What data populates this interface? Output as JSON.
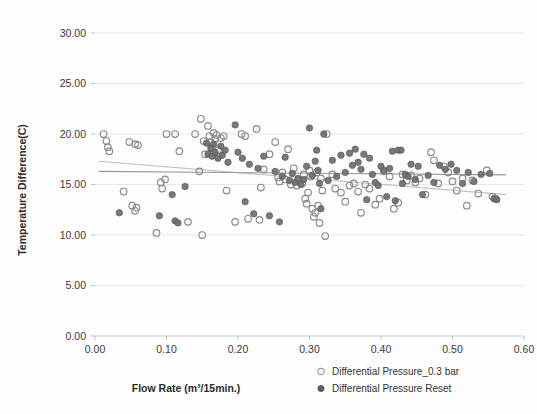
{
  "chart_data": {
    "type": "scatter",
    "title": "",
    "xlabel": "Flow Rate (m³/15min.)",
    "ylabel": "Temperature Difference(C)",
    "xlim": [
      0.0,
      0.6
    ],
    "ylim": [
      0.0,
      30.0
    ],
    "xticks": [
      "0.00",
      "0.10",
      "0.20",
      "0.30",
      "0.40",
      "0.50",
      "0.60"
    ],
    "yticks": [
      "0.00",
      "5.00",
      "10.00",
      "15.00",
      "20.00",
      "25.00",
      "30.00"
    ],
    "xtick_values": [
      0.0,
      0.1,
      0.2,
      0.3,
      0.4,
      0.5,
      0.6
    ],
    "ytick_values": [
      0.0,
      5.0,
      10.0,
      15.0,
      20.0,
      25.0,
      30.0
    ],
    "grid": true,
    "grid_axis": "y",
    "legend_position": "bottom-right",
    "series": [
      {
        "name": "Differential Pressure_0.3 bar",
        "marker": "open-circle",
        "color": "#ffffff",
        "edge_color": "#8a8a8a",
        "points": [
          [
            0.012,
            20.0
          ],
          [
            0.016,
            19.3
          ],
          [
            0.018,
            18.7
          ],
          [
            0.02,
            18.3
          ],
          [
            0.048,
            19.2
          ],
          [
            0.056,
            19.0
          ],
          [
            0.06,
            18.9
          ],
          [
            0.04,
            14.3
          ],
          [
            0.052,
            12.9
          ],
          [
            0.056,
            12.4
          ],
          [
            0.058,
            12.7
          ],
          [
            0.086,
            10.2
          ],
          [
            0.092,
            15.2
          ],
          [
            0.094,
            14.6
          ],
          [
            0.098,
            15.5
          ],
          [
            0.1,
            20.0
          ],
          [
            0.112,
            20.0
          ],
          [
            0.118,
            18.3
          ],
          [
            0.13,
            11.3
          ],
          [
            0.14,
            20.0
          ],
          [
            0.146,
            16.3
          ],
          [
            0.148,
            21.5
          ],
          [
            0.15,
            10.0
          ],
          [
            0.152,
            19.3
          ],
          [
            0.154,
            18.0
          ],
          [
            0.158,
            20.8
          ],
          [
            0.16,
            19.8
          ],
          [
            0.162,
            19.2
          ],
          [
            0.164,
            18.6
          ],
          [
            0.166,
            20.1
          ],
          [
            0.168,
            19.5
          ],
          [
            0.17,
            19.9
          ],
          [
            0.172,
            18.4
          ],
          [
            0.176,
            19.6
          ],
          [
            0.18,
            19.8
          ],
          [
            0.184,
            14.4
          ],
          [
            0.196,
            11.3
          ],
          [
            0.205,
            20.0
          ],
          [
            0.21,
            19.8
          ],
          [
            0.214,
            11.6
          ],
          [
            0.226,
            20.5
          ],
          [
            0.23,
            11.5
          ],
          [
            0.232,
            14.7
          ],
          [
            0.236,
            16.5
          ],
          [
            0.244,
            18.0
          ],
          [
            0.252,
            19.2
          ],
          [
            0.256,
            15.7
          ],
          [
            0.258,
            15.3
          ],
          [
            0.262,
            16.2
          ],
          [
            0.266,
            15.5
          ],
          [
            0.27,
            18.5
          ],
          [
            0.274,
            15.0
          ],
          [
            0.278,
            16.6
          ],
          [
            0.282,
            14.9
          ],
          [
            0.286,
            15.4
          ],
          [
            0.29,
            15.1
          ],
          [
            0.292,
            16.0
          ],
          [
            0.294,
            13.6
          ],
          [
            0.296,
            13.1
          ],
          [
            0.298,
            14.2
          ],
          [
            0.3,
            16.4
          ],
          [
            0.302,
            15.8
          ],
          [
            0.304,
            12.6
          ],
          [
            0.306,
            11.8
          ],
          [
            0.308,
            12.2
          ],
          [
            0.31,
            16.2
          ],
          [
            0.312,
            12.9
          ],
          [
            0.314,
            11.2
          ],
          [
            0.316,
            15.6
          ],
          [
            0.318,
            14.4
          ],
          [
            0.322,
            9.9
          ],
          [
            0.324,
            20.0
          ],
          [
            0.332,
            16.0
          ],
          [
            0.336,
            14.6
          ],
          [
            0.344,
            14.2
          ],
          [
            0.35,
            13.3
          ],
          [
            0.356,
            14.9
          ],
          [
            0.362,
            15.1
          ],
          [
            0.368,
            14.3
          ],
          [
            0.372,
            12.2
          ],
          [
            0.378,
            15.0
          ],
          [
            0.384,
            14.6
          ],
          [
            0.392,
            13.0
          ],
          [
            0.398,
            13.6
          ],
          [
            0.404,
            16.3
          ],
          [
            0.412,
            15.8
          ],
          [
            0.418,
            12.6
          ],
          [
            0.424,
            13.2
          ],
          [
            0.43,
            16.0
          ],
          [
            0.436,
            15.4
          ],
          [
            0.442,
            15.9
          ],
          [
            0.448,
            15.2
          ],
          [
            0.454,
            15.6
          ],
          [
            0.462,
            14.0
          ],
          [
            0.47,
            18.2
          ],
          [
            0.474,
            17.4
          ],
          [
            0.48,
            15.1
          ],
          [
            0.488,
            16.8
          ],
          [
            0.494,
            16.2
          ],
          [
            0.5,
            15.3
          ],
          [
            0.506,
            14.4
          ],
          [
            0.514,
            15.6
          ],
          [
            0.52,
            12.9
          ],
          [
            0.528,
            15.4
          ],
          [
            0.536,
            14.1
          ],
          [
            0.548,
            16.4
          ],
          [
            0.556,
            13.8
          ],
          [
            0.56,
            13.6
          ]
        ]
      },
      {
        "name": "Differential Pressure Reset",
        "marker": "filled-circle",
        "color": "#6e6e6e",
        "edge_color": "#5a5a5a",
        "points": [
          [
            0.034,
            12.2
          ],
          [
            0.09,
            11.9
          ],
          [
            0.108,
            14.0
          ],
          [
            0.112,
            11.4
          ],
          [
            0.116,
            11.2
          ],
          [
            0.126,
            14.8
          ],
          [
            0.156,
            19.1
          ],
          [
            0.158,
            18.0
          ],
          [
            0.162,
            18.6
          ],
          [
            0.164,
            17.8
          ],
          [
            0.166,
            19.0
          ],
          [
            0.168,
            18.2
          ],
          [
            0.172,
            17.6
          ],
          [
            0.176,
            18.8
          ],
          [
            0.178,
            17.9
          ],
          [
            0.182,
            18.4
          ],
          [
            0.186,
            17.2
          ],
          [
            0.196,
            20.9
          ],
          [
            0.2,
            18.2
          ],
          [
            0.206,
            17.6
          ],
          [
            0.21,
            13.3
          ],
          [
            0.216,
            17.0
          ],
          [
            0.222,
            12.1
          ],
          [
            0.228,
            16.6
          ],
          [
            0.236,
            17.8
          ],
          [
            0.244,
            11.9
          ],
          [
            0.252,
            16.3
          ],
          [
            0.258,
            11.3
          ],
          [
            0.262,
            15.8
          ],
          [
            0.266,
            17.7
          ],
          [
            0.272,
            15.4
          ],
          [
            0.276,
            16.1
          ],
          [
            0.28,
            15.2
          ],
          [
            0.284,
            15.6
          ],
          [
            0.288,
            15.0
          ],
          [
            0.292,
            15.5
          ],
          [
            0.296,
            16.8
          ],
          [
            0.3,
            20.6
          ],
          [
            0.304,
            15.9
          ],
          [
            0.308,
            17.3
          ],
          [
            0.31,
            18.4
          ],
          [
            0.312,
            16.4
          ],
          [
            0.314,
            15.1
          ],
          [
            0.316,
            12.6
          ],
          [
            0.32,
            20.0
          ],
          [
            0.326,
            15.4
          ],
          [
            0.332,
            17.4
          ],
          [
            0.338,
            15.8
          ],
          [
            0.344,
            17.9
          ],
          [
            0.35,
            16.2
          ],
          [
            0.356,
            18.1
          ],
          [
            0.36,
            16.9
          ],
          [
            0.364,
            18.5
          ],
          [
            0.368,
            17.2
          ],
          [
            0.372,
            16.5
          ],
          [
            0.376,
            18.0
          ],
          [
            0.38,
            13.5
          ],
          [
            0.384,
            17.6
          ],
          [
            0.388,
            16.0
          ],
          [
            0.392,
            15.2
          ],
          [
            0.396,
            14.9
          ],
          [
            0.4,
            16.8
          ],
          [
            0.404,
            16.4
          ],
          [
            0.408,
            13.8
          ],
          [
            0.412,
            16.6
          ],
          [
            0.416,
            18.3
          ],
          [
            0.42,
            13.4
          ],
          [
            0.424,
            18.4
          ],
          [
            0.428,
            18.4
          ],
          [
            0.43,
            15.1
          ],
          [
            0.434,
            16.0
          ],
          [
            0.438,
            15.8
          ],
          [
            0.442,
            17.0
          ],
          [
            0.448,
            15.5
          ],
          [
            0.452,
            16.8
          ],
          [
            0.458,
            14.0
          ],
          [
            0.466,
            15.9
          ],
          [
            0.474,
            15.2
          ],
          [
            0.482,
            16.9
          ],
          [
            0.49,
            16.5
          ],
          [
            0.498,
            17.0
          ],
          [
            0.506,
            16.4
          ],
          [
            0.514,
            15.1
          ],
          [
            0.522,
            16.2
          ],
          [
            0.53,
            15.3
          ],
          [
            0.54,
            16.0
          ],
          [
            0.552,
            16.1
          ],
          [
            0.558,
            13.6
          ],
          [
            0.562,
            13.5
          ]
        ]
      }
    ],
    "trendlines": [
      {
        "name": "Differential Pressure_0.3 bar trend",
        "color": "#c0c0c0",
        "x0": 0.005,
        "y0": 17.3,
        "x1": 0.575,
        "y1": 14.0
      },
      {
        "name": "Differential Pressure Reset trend",
        "color": "#9a9a9a",
        "x0": 0.005,
        "y0": 16.3,
        "x1": 0.575,
        "y1": 15.95
      }
    ]
  },
  "legend": {
    "items": [
      {
        "label": "Differential Pressure_0.3 bar",
        "marker": "open-circle"
      },
      {
        "label": "Differential Pressure Reset",
        "marker": "filled-circle"
      }
    ]
  },
  "colors": {
    "background": "#fdfdfd",
    "grid": "#e2e2e2",
    "axis": "#c8c8c8",
    "text": "#3a3a3a",
    "series_open_edge": "#8a8a8a",
    "series_filled": "#6e6e6e",
    "trend_light": "#c0c0c0",
    "trend_dark": "#9a9a9a"
  }
}
